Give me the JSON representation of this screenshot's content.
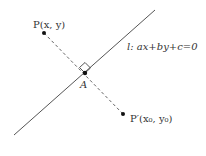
{
  "diagram": {
    "line_label": "l: ax+by+c=0",
    "line_label_parts": {
      "l": "l",
      "eq": ": ax+by+c=0"
    },
    "point_P": {
      "label": "P(x, y)",
      "name": "P",
      "coords": "(x, y)"
    },
    "point_A": {
      "label": "A"
    },
    "point_P_prime": {
      "label": "P′(x₀, y₀)",
      "name": "P′",
      "coords": "(x₀, y₀)"
    },
    "colors": {
      "line": "#555555",
      "dashed": "#666666",
      "point": "#111111",
      "text": "#333333"
    }
  }
}
